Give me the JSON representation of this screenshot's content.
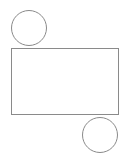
{
  "figure": {
    "background_color": "#ffffff",
    "canvas": {
      "width": 126,
      "height": 158
    },
    "stroke_color": "#8a8a8a",
    "stroke_width": 1,
    "rectangle_fill": "#fdfdfd",
    "circle_fill": "#ffffff",
    "shapes": [
      {
        "name": "top-left-circle",
        "type": "circle",
        "label": "Circle",
        "cx": 29,
        "cy": 28,
        "r": 18,
        "diameter": 36,
        "stroke": "#8a8a8a",
        "fill": "#ffffff"
      },
      {
        "name": "main-rectangle",
        "type": "rectangle",
        "label": "Rectangle",
        "x": 11,
        "y": 48,
        "width": 108,
        "height": 67,
        "stroke": "#8a8a8a",
        "fill": "#fdfdfd"
      },
      {
        "name": "bottom-right-circle",
        "type": "circle",
        "label": "Circle",
        "cx": 100,
        "cy": 135,
        "r": 18,
        "diameter": 36,
        "stroke": "#8a8a8a",
        "fill": "#ffffff"
      }
    ]
  }
}
